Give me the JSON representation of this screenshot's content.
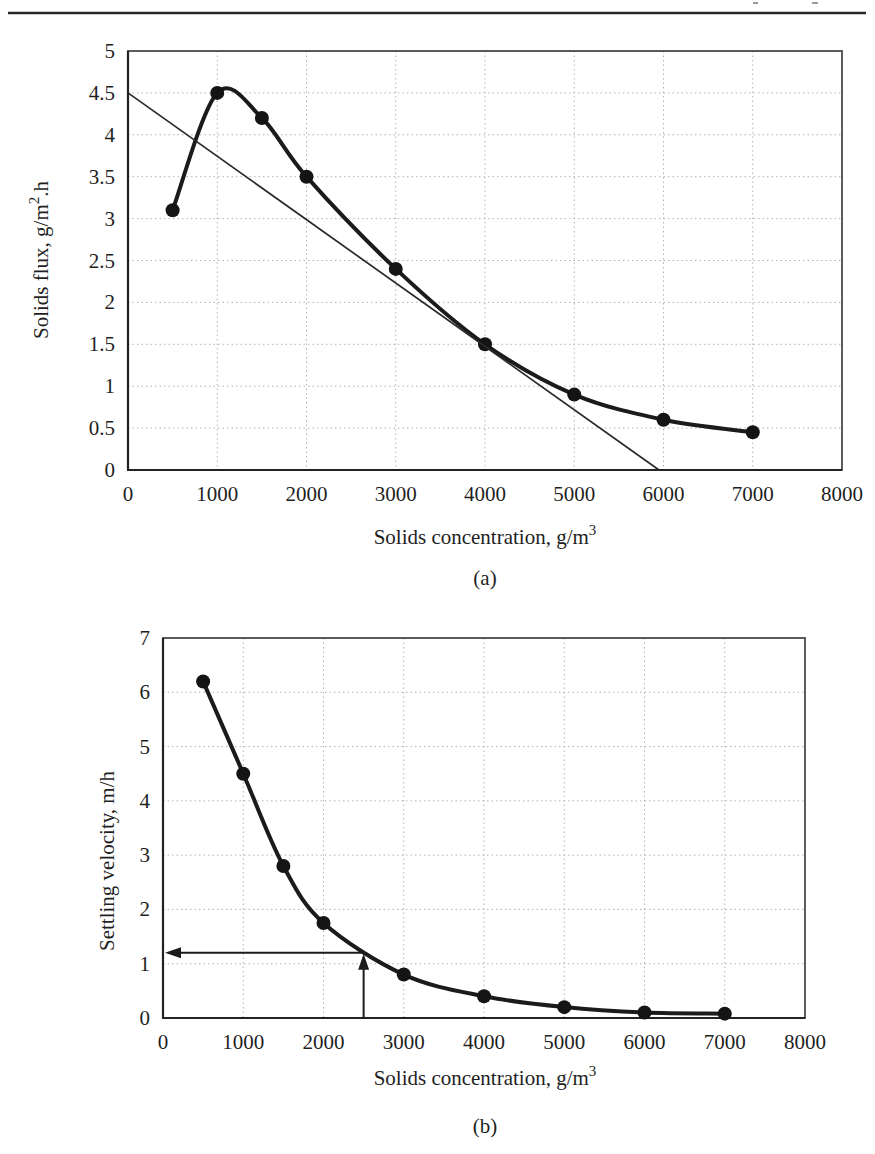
{
  "figure": {
    "caption_a": "(a)",
    "caption_b": "(b)"
  },
  "chart_data": [
    {
      "id": "a",
      "type": "line",
      "title": "",
      "xlabel": "Solids concentration, g/m³",
      "xlabel_main": "Solids concentration, g/m",
      "xlabel_sup": "3",
      "ylabel": "Solids flux, g/m².h",
      "ylabel_main": "Solids flux, g/m",
      "ylabel_sup": "2",
      "ylabel_after_sup": ".h",
      "caption": "(a)",
      "xlim": [
        0,
        8000
      ],
      "ylim": [
        0,
        5
      ],
      "grid": true,
      "legend": "none",
      "x_ticks": [
        0,
        1000,
        2000,
        3000,
        4000,
        5000,
        6000,
        7000,
        8000
      ],
      "x_tick_labels": [
        "0",
        "1000",
        "2000",
        "3000",
        "4000",
        "5000",
        "6000",
        "7000",
        "8000"
      ],
      "y_ticks": [
        0,
        0.5,
        1,
        1.5,
        2,
        2.5,
        3,
        3.5,
        4,
        4.5,
        5
      ],
      "y_tick_labels": [
        "0",
        "0.5",
        "1",
        "1.5",
        "2",
        "2.5",
        "3",
        "3.5",
        "4",
        "4.5",
        "5"
      ],
      "series": [
        {
          "name": "solids-flux-curve",
          "role": "data-curve",
          "x": [
            500,
            1000,
            1500,
            2000,
            3000,
            4000,
            5000,
            6000,
            7000
          ],
          "y": [
            3.1,
            4.5,
            4.2,
            3.5,
            2.4,
            1.5,
            0.9,
            0.6,
            0.45
          ]
        },
        {
          "name": "tangent-operating-line",
          "role": "tangent",
          "x": [
            0,
            5950
          ],
          "y": [
            4.5,
            0
          ]
        }
      ]
    },
    {
      "id": "b",
      "type": "line",
      "title": "",
      "xlabel": "Solids concentration, g/m³",
      "xlabel_main": "Solids concentration, g/m",
      "xlabel_sup": "3",
      "ylabel": "Settling velocity, m/h",
      "ylabel_main": "Settling velocity, m/h",
      "ylabel_sup": "",
      "ylabel_after_sup": "",
      "caption": "(b)",
      "xlim": [
        0,
        8000
      ],
      "ylim": [
        0,
        7
      ],
      "grid": true,
      "legend": "none",
      "x_ticks": [
        0,
        1000,
        2000,
        3000,
        4000,
        5000,
        6000,
        7000,
        8000
      ],
      "x_tick_labels": [
        "0",
        "1000",
        "2000",
        "3000",
        "4000",
        "5000",
        "6000",
        "7000",
        "8000"
      ],
      "y_ticks": [
        0,
        1,
        2,
        3,
        4,
        5,
        6,
        7
      ],
      "y_tick_labels": [
        "0",
        "1",
        "2",
        "3",
        "4",
        "5",
        "6",
        "7"
      ],
      "series": [
        {
          "name": "settling-velocity-curve",
          "role": "data-curve",
          "x": [
            500,
            1000,
            1500,
            2000,
            3000,
            4000,
            5000,
            6000,
            7000
          ],
          "y": [
            6.2,
            4.5,
            2.8,
            1.75,
            0.8,
            0.4,
            0.2,
            0.1,
            0.08
          ]
        }
      ],
      "annotation": {
        "type": "crosshair-arrows",
        "x": 2500,
        "y": 1.2
      }
    }
  ]
}
